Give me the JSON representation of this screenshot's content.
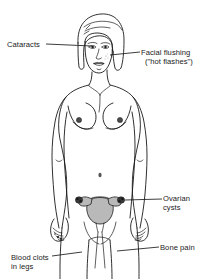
{
  "figure": {
    "background_color": "#ffffff",
    "line_color": "#1a1a1a",
    "organ_shade_color": "#b9b9b9"
  },
  "labels": {
    "cataracts": {
      "text": "Cataracts",
      "points_to": "eye"
    },
    "facial_flushing": {
      "line1": "Facial flushing",
      "line2": "(\"hot flashes\")",
      "points_to": "cheek"
    },
    "ovarian_cysts": {
      "line1": "Ovarian",
      "line2": "cysts",
      "points_to": "ovary"
    },
    "blood_clots": {
      "line1": "Blood clots",
      "line2": "in legs",
      "points_to": "leg"
    },
    "bone_pain": {
      "text": "Bone pain",
      "points_to": "leg"
    }
  },
  "anatomy": {
    "parts": [
      "head",
      "hair",
      "face",
      "eyes",
      "nose",
      "lips",
      "neck",
      "shoulders",
      "breasts",
      "nipples",
      "navel",
      "arms",
      "hands",
      "hips",
      "legs",
      "uterus",
      "fallopian-tubes",
      "ovaries",
      "vagina"
    ]
  }
}
